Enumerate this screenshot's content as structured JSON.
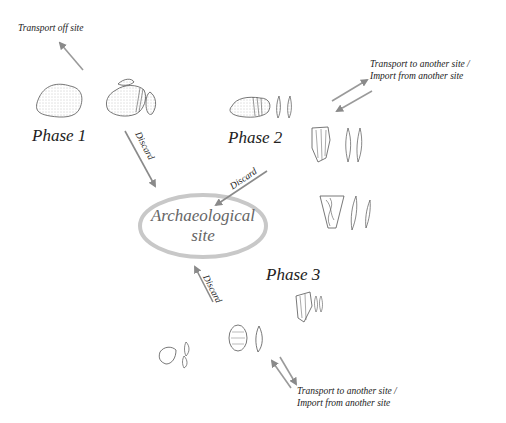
{
  "diagram": {
    "phases": [
      {
        "label": "Phase 1"
      },
      {
        "label": "Phase 2"
      },
      {
        "label": "Phase 3"
      }
    ],
    "center": {
      "line1": "Archaeological",
      "line2": "site"
    },
    "flows": {
      "transport_off": "Transport off site",
      "transport_to_1": "Transport to another site /",
      "import_from_1": "Import from another site",
      "transport_to_2": "Transport to another site /",
      "import_from_2": "Import from another site",
      "discard_1": "Discard",
      "discard_2": "Discard",
      "discard_3": "Discard"
    },
    "colors": {
      "arrow": "#9a9a9a",
      "ellipse": "#c8c8c8",
      "ink": "#555555"
    }
  }
}
